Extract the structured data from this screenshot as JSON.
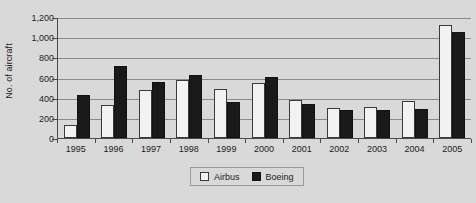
{
  "chart_data": {
    "type": "bar",
    "title": "",
    "xlabel": "",
    "ylabel": "No. of aircraft",
    "categories": [
      "1995",
      "1996",
      "1997",
      "1998",
      "1999",
      "2000",
      "2001",
      "2002",
      "2003",
      "2004",
      "2005"
    ],
    "series": [
      {
        "name": "Airbus",
        "color": "#f2f2f2",
        "values": [
          125,
          326,
          480,
          575,
          485,
          545,
          375,
          300,
          305,
          370,
          1120
        ]
      },
      {
        "name": "Boeing",
        "color": "#1a1a1a",
        "values": [
          430,
          710,
          560,
          620,
          360,
          610,
          340,
          280,
          280,
          285,
          1050
        ]
      }
    ],
    "ylim": [
      0,
      1200
    ],
    "yticks": [
      0,
      200,
      400,
      600,
      800,
      1000,
      1200
    ],
    "ytick_labels": [
      "0",
      "200",
      "400",
      "600",
      "800",
      "1,000",
      "1,200"
    ],
    "grid": "horizontal",
    "legend_position": "bottom-center",
    "legend_entries": [
      "Airbus",
      "Boeing"
    ]
  }
}
